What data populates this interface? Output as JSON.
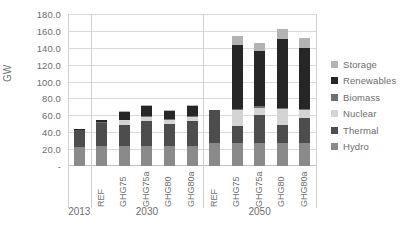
{
  "chart_data": {
    "type": "bar",
    "title": "",
    "xlabel": "",
    "ylabel": "GW",
    "ylim": [
      0,
      180
    ],
    "ytick_step": 20,
    "grid": true,
    "stacked": true,
    "legend_position": "right",
    "groups": [
      {
        "name": "2013",
        "categories": [
          "2013"
        ]
      },
      {
        "name": "2030",
        "categories": [
          "REF",
          "GHG75",
          "GHG75a",
          "GHG80",
          "GHG80a"
        ]
      },
      {
        "name": "2050",
        "categories": [
          "REF",
          "GHG75",
          "GHG75a",
          "GHG80",
          "GHG80a"
        ]
      }
    ],
    "ytick_labels": [
      "180.0",
      "160.0",
      "140.0",
      "120.0",
      "100.0",
      "80.0",
      "60.0",
      "40.0",
      "20.0",
      "-"
    ],
    "ytick_values": [
      180,
      160,
      140,
      120,
      100,
      80,
      60,
      40,
      20,
      0
    ],
    "x": [
      "2013",
      "REF",
      "GHG75",
      "GHG75a",
      "GHG80",
      "GHG80a",
      "REF",
      "GHG75",
      "GHG75a",
      "GHG80",
      "GHG80a"
    ],
    "series": [
      {
        "name": "Hydro",
        "color": "#8a8a8a",
        "values": [
          22.0,
          24.0,
          24.0,
          24.0,
          24.0,
          24.0,
          27.0,
          27.0,
          27.0,
          27.0,
          27.0
        ]
      },
      {
        "name": "Thermal",
        "color": "#4d4d4d",
        "values": [
          21.0,
          27.0,
          25.0,
          29.0,
          26.0,
          29.0,
          39.0,
          20.0,
          33.0,
          21.0,
          30.0
        ]
      },
      {
        "name": "Nuclear",
        "color": "#d4d4d4",
        "values": [
          0.0,
          0.0,
          5.0,
          5.0,
          5.0,
          5.0,
          0.0,
          19.0,
          9.0,
          19.0,
          9.0
        ]
      },
      {
        "name": "Biomass",
        "color": "#707070",
        "values": [
          0.0,
          1.0,
          1.0,
          1.0,
          1.0,
          1.0,
          0.0,
          2.0,
          2.0,
          2.0,
          2.0
        ]
      },
      {
        "name": "Renewables",
        "color": "#262626",
        "values": [
          1.0,
          3.0,
          9.0,
          12.0,
          9.0,
          12.0,
          0.0,
          75.0,
          65.0,
          81.0,
          72.0
        ]
      },
      {
        "name": "Storage",
        "color": "#b3b3b3",
        "values": [
          0.0,
          0.0,
          1.0,
          1.0,
          1.0,
          1.0,
          0.0,
          11.0,
          10.0,
          12.0,
          12.0
        ]
      }
    ],
    "totals": [
      44.0,
      55.0,
      65.0,
      72.0,
      66.0,
      72.0,
      66.0,
      154.0,
      146.0,
      162.0,
      152.0
    ]
  },
  "legend": {
    "items": [
      {
        "label": "Storage",
        "color": "#b3b3b3"
      },
      {
        "label": "Renewables",
        "color": "#262626"
      },
      {
        "label": "Biomass",
        "color": "#707070"
      },
      {
        "label": "Nuclear",
        "color": "#d4d4d4"
      },
      {
        "label": "Thermal",
        "color": "#4d4d4d"
      },
      {
        "label": "Hydro",
        "color": "#8a8a8a"
      }
    ]
  },
  "axis": {
    "y_title": "GW"
  }
}
